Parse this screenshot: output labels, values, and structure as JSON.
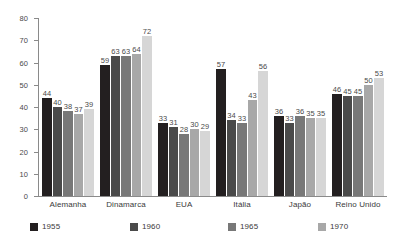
{
  "chart_data": {
    "type": "bar",
    "title": "",
    "subtitle": "",
    "xlabel": "",
    "ylabel": "",
    "ylim": [
      0,
      80
    ],
    "ytick_values": [
      0,
      10,
      20,
      30,
      40,
      50,
      60,
      70,
      80
    ],
    "ytick_labels": [
      "0",
      "10",
      "20",
      "30",
      "40",
      "50",
      "60",
      "70",
      "80"
    ],
    "grid": false,
    "legend_position": "bottom",
    "categories": [
      "Alemanha",
      "Dinamarca",
      "EUA",
      "Itália",
      "Japão",
      "Reino Unido"
    ],
    "series": [
      {
        "name": "1955",
        "color": "#231f20",
        "values": [
          44,
          59,
          33,
          57,
          36,
          46
        ]
      },
      {
        "name": "1960",
        "color": "#4a4a4a",
        "values": [
          40,
          63,
          31,
          34,
          33,
          45
        ]
      },
      {
        "name": "1965",
        "color": "#787878",
        "values": [
          38,
          63,
          28,
          33,
          36,
          45
        ]
      },
      {
        "name": "1970",
        "color": "#a8a8a8",
        "values": [
          37,
          64,
          30,
          43,
          35,
          50
        ]
      },
      {
        "name": "1975",
        "color": "#d6d6d6",
        "values": [
          39,
          72,
          29,
          56,
          35,
          53
        ]
      }
    ]
  },
  "legend": {
    "items": [
      {
        "label": "1955",
        "color": "#231f20"
      },
      {
        "label": "1960",
        "color": "#4a4a4a"
      },
      {
        "label": "1965",
        "color": "#787878"
      },
      {
        "label": "1970",
        "color": "#a8a8a8"
      },
      {
        "label": "1975",
        "color": "#d6d6d6"
      }
    ]
  }
}
